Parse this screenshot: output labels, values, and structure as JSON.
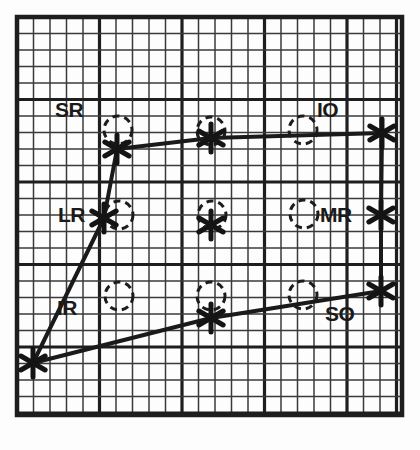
{
  "chart_data": {
    "type": "scatter",
    "title": "",
    "subtitle": "",
    "xlabel": "",
    "ylabel": "",
    "grid": {
      "show": true,
      "minor_cell_px": 16.5,
      "cols": 23,
      "rows": 24,
      "major_every": 5,
      "x0": 17,
      "y0": 17,
      "x1": 402,
      "y1": 415,
      "minor_color": "#3a3a3a",
      "major_color": "#1e1e1e",
      "background": "#ffffff"
    },
    "normal_positions": {
      "marker": "dashed-circle",
      "radius_px": 14,
      "points": [
        {
          "id": "n-tl",
          "x": 118,
          "y": 130
        },
        {
          "id": "n-tc",
          "x": 211,
          "y": 131
        },
        {
          "id": "n-tr",
          "x": 303,
          "y": 130
        },
        {
          "id": "n-ml",
          "x": 119,
          "y": 215
        },
        {
          "id": "n-mc",
          "x": 212,
          "y": 215
        },
        {
          "id": "n-mr",
          "x": 304,
          "y": 214
        },
        {
          "id": "n-bl",
          "x": 119,
          "y": 296
        },
        {
          "id": "n-bc",
          "x": 211,
          "y": 296
        },
        {
          "id": "n-br",
          "x": 303,
          "y": 295
        }
      ]
    },
    "plotted_points": {
      "marker": "asterisk",
      "color": "#141414",
      "points": [
        {
          "id": "p-tl",
          "label": "SR",
          "x": 117,
          "y": 149
        },
        {
          "id": "p-tc",
          "label": "",
          "x": 211,
          "y": 138
        },
        {
          "id": "p-tr",
          "label": "IO",
          "x": 382,
          "y": 133
        },
        {
          "id": "p-ml",
          "label": "LR",
          "x": 104,
          "y": 218
        },
        {
          "id": "p-mc",
          "label": "",
          "x": 211,
          "y": 225
        },
        {
          "id": "p-mr",
          "label": "MR",
          "x": 381,
          "y": 215
        },
        {
          "id": "p-bl",
          "label": "IR",
          "x": 33,
          "y": 363
        },
        {
          "id": "p-bc",
          "label": "",
          "x": 211,
          "y": 318
        },
        {
          "id": "p-br",
          "label": "SO",
          "x": 381,
          "y": 291
        }
      ]
    },
    "connection_paths": [
      {
        "id": "outer-path",
        "points": [
          [
            117,
            149
          ],
          [
            211,
            138
          ],
          [
            382,
            133
          ],
          [
            381,
            215
          ],
          [
            381,
            291
          ],
          [
            211,
            318
          ],
          [
            33,
            363
          ],
          [
            104,
            218
          ],
          [
            117,
            149
          ]
        ],
        "color": "#1a1a1a",
        "width": 4
      }
    ],
    "labels": [
      {
        "id": "SR",
        "text": "SR",
        "x": 55,
        "y": 99
      },
      {
        "id": "IO",
        "text": "IO",
        "x": 317,
        "y": 99
      },
      {
        "id": "LR",
        "text": "LR",
        "x": 58,
        "y": 204
      },
      {
        "id": "MR",
        "text": "MR",
        "x": 320,
        "y": 204
      },
      {
        "id": "IR",
        "text": "IR",
        "x": 57,
        "y": 297
      },
      {
        "id": "SO",
        "text": "SO",
        "x": 325,
        "y": 303
      }
    ],
    "legend": {
      "show": false,
      "position": "none"
    }
  }
}
